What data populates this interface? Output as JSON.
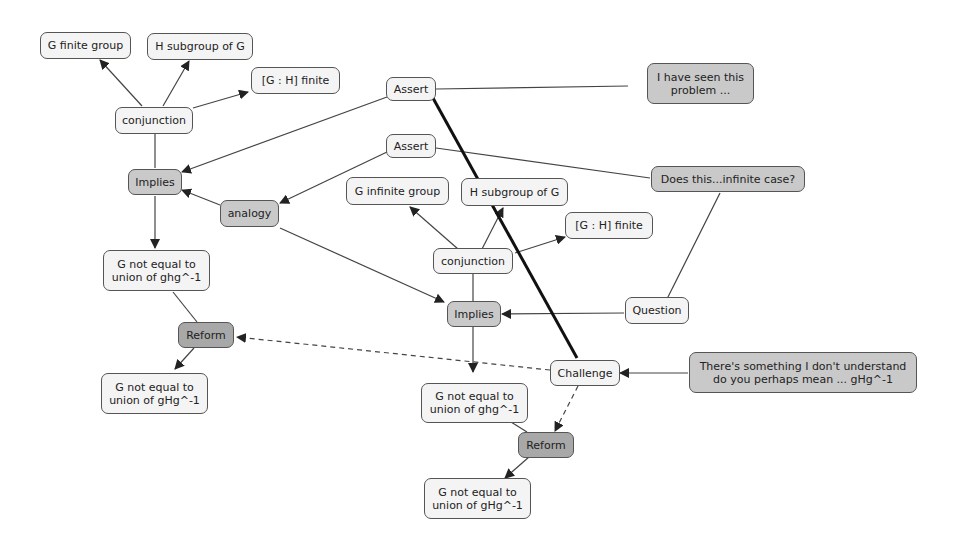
{
  "nodes": {
    "g_finite_group": "G finite group",
    "h_subgroup_left": "H subgroup of G",
    "gh_finite_left": "[G : H] finite",
    "conjunction_left": "conjunction",
    "implies_left": "Implies",
    "analogy": "analogy",
    "g_not_equal_ghg_left": "G not equal to union of ghg^-1",
    "reform_left": "Reform",
    "g_not_equal_gHg_left": "G not equal to union of gHg^-1",
    "assert_top": "Assert",
    "assert_second": "Assert",
    "seen_problem": "I have seen this problem ...",
    "does_this": "Does this...infinite case?",
    "g_infinite_group": "G infinite group",
    "h_subgroup_right": "H subgroup of G",
    "gh_finite_right": "[G : H] finite",
    "conjunction_right": "conjunction",
    "implies_right": "Implies",
    "question": "Question",
    "challenge": "Challenge",
    "something_dont_understand": "There's something I don't understand do you perhaps mean ... gHg^-1",
    "g_not_equal_ghg_right": "G not equal to union of ghg^-1",
    "reform_right": "Reform",
    "g_not_equal_gHg_right": "G not equal to union of gHg^-1"
  }
}
